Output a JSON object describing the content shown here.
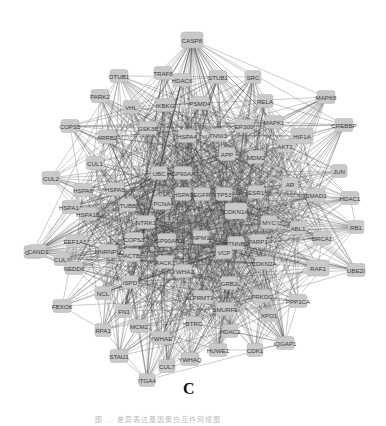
{
  "figure": {
    "panel_label": "C",
    "caption": "图 … 差异表达基因蛋白互作网络图",
    "node_color": "#c9c9c9",
    "edge_color": "#3a3a3a"
  },
  "network": {
    "hub_node": "CASP8",
    "nodes": [
      {
        "id": "CASP8",
        "x": 192,
        "y": 40,
        "w": 22,
        "h": 16
      },
      {
        "id": "OTUB1",
        "x": 119,
        "y": 76,
        "w": 18,
        "h": 13
      },
      {
        "id": "TRAF6",
        "x": 163,
        "y": 73,
        "w": 18,
        "h": 13
      },
      {
        "id": "HDAC6",
        "x": 182,
        "y": 80,
        "w": 18,
        "h": 13
      },
      {
        "id": "STUB1",
        "x": 218,
        "y": 77,
        "w": 18,
        "h": 13
      },
      {
        "id": "SRC",
        "x": 253,
        "y": 77,
        "w": 16,
        "h": 13
      },
      {
        "id": "PARK2",
        "x": 100,
        "y": 96,
        "w": 18,
        "h": 13
      },
      {
        "id": "VHL",
        "x": 131,
        "y": 107,
        "w": 16,
        "h": 13
      },
      {
        "id": "IKBKG",
        "x": 165,
        "y": 105,
        "w": 18,
        "h": 13
      },
      {
        "id": "PSMD4",
        "x": 200,
        "y": 103,
        "w": 18,
        "h": 13
      },
      {
        "id": "RELA",
        "x": 265,
        "y": 101,
        "w": 16,
        "h": 13
      },
      {
        "id": "MAPK8",
        "x": 326,
        "y": 97,
        "w": 18,
        "h": 13
      },
      {
        "id": "COPS5",
        "x": 70,
        "y": 126,
        "w": 18,
        "h": 13
      },
      {
        "id": "GSK3B",
        "x": 148,
        "y": 128,
        "w": 18,
        "h": 13
      },
      {
        "id": "HSPA4",
        "x": 187,
        "y": 136,
        "w": 18,
        "h": 13
      },
      {
        "id": "EP300",
        "x": 244,
        "y": 126,
        "w": 18,
        "h": 13
      },
      {
        "id": "MAPK1",
        "x": 274,
        "y": 122,
        "w": 18,
        "h": 13
      },
      {
        "id": "HIF1A",
        "x": 302,
        "y": 136,
        "w": 22,
        "h": 16
      },
      {
        "id": "CREBBP",
        "x": 344,
        "y": 125,
        "w": 18,
        "h": 13
      },
      {
        "id": "ARRB2",
        "x": 107,
        "y": 137,
        "w": 18,
        "h": 13
      },
      {
        "id": "TNNI3",
        "x": 218,
        "y": 135,
        "w": 16,
        "h": 13
      },
      {
        "id": "AKT1",
        "x": 285,
        "y": 146,
        "w": 16,
        "h": 13
      },
      {
        "id": "CUL1",
        "x": 95,
        "y": 163,
        "w": 18,
        "h": 13
      },
      {
        "id": "UBC",
        "x": 159,
        "y": 173,
        "w": 16,
        "h": 13
      },
      {
        "id": "HSP90AA1",
        "x": 183,
        "y": 173,
        "w": 18,
        "h": 13
      },
      {
        "id": "APP",
        "x": 227,
        "y": 154,
        "w": 16,
        "h": 13
      },
      {
        "id": "MDM2",
        "x": 256,
        "y": 157,
        "w": 16,
        "h": 13
      },
      {
        "id": "JUN",
        "x": 339,
        "y": 171,
        "w": 16,
        "h": 13
      },
      {
        "id": "CUL2",
        "x": 51,
        "y": 178,
        "w": 18,
        "h": 13
      },
      {
        "id": "HSPA8",
        "x": 83,
        "y": 190,
        "w": 18,
        "h": 13
      },
      {
        "id": "HSPA5",
        "x": 115,
        "y": 189,
        "w": 18,
        "h": 13
      },
      {
        "id": "TUBB",
        "x": 128,
        "y": 205,
        "w": 16,
        "h": 13
      },
      {
        "id": "PCNA",
        "x": 162,
        "y": 203,
        "w": 18,
        "h": 13
      },
      {
        "id": "HSPA9",
        "x": 183,
        "y": 194,
        "w": 16,
        "h": 13
      },
      {
        "id": "EGFR",
        "x": 202,
        "y": 194,
        "w": 16,
        "h": 13
      },
      {
        "id": "TP53",
        "x": 224,
        "y": 194,
        "w": 16,
        "h": 13
      },
      {
        "id": "ESR1",
        "x": 256,
        "y": 192,
        "w": 16,
        "h": 13
      },
      {
        "id": "AR",
        "x": 290,
        "y": 184,
        "w": 16,
        "h": 13
      },
      {
        "id": "SMAD3",
        "x": 316,
        "y": 195,
        "w": 18,
        "h": 13
      },
      {
        "id": "HDAC1",
        "x": 350,
        "y": 198,
        "w": 18,
        "h": 13
      },
      {
        "id": "HSPA1A",
        "x": 71,
        "y": 207,
        "w": 18,
        "h": 13
      },
      {
        "id": "HSPA1B",
        "x": 88,
        "y": 214,
        "w": 18,
        "h": 13
      },
      {
        "id": "CDKN1A",
        "x": 236,
        "y": 211,
        "w": 22,
        "h": 16
      },
      {
        "id": "NTRK1",
        "x": 146,
        "y": 222,
        "w": 18,
        "h": 13
      },
      {
        "id": "MYC",
        "x": 269,
        "y": 222,
        "w": 16,
        "h": 13
      },
      {
        "id": "ABL1",
        "x": 298,
        "y": 228,
        "w": 16,
        "h": 13
      },
      {
        "id": "CUL3",
        "x": 33,
        "y": 252,
        "w": 18,
        "h": 13
      },
      {
        "id": "CAND1",
        "x": 38,
        "y": 251,
        "w": 18,
        "h": 13
      },
      {
        "id": "EEF1A1",
        "x": 75,
        "y": 241,
        "w": 18,
        "h": 13
      },
      {
        "id": "COPS3",
        "x": 134,
        "y": 239,
        "w": 18,
        "h": 13
      },
      {
        "id": "HSP90AB1",
        "x": 167,
        "y": 240,
        "w": 18,
        "h": 13
      },
      {
        "id": "NPM1",
        "x": 201,
        "y": 237,
        "w": 16,
        "h": 13
      },
      {
        "id": "CTNNB1",
        "x": 236,
        "y": 243,
        "w": 16,
        "h": 13
      },
      {
        "id": "VCP",
        "x": 224,
        "y": 252,
        "w": 16,
        "h": 13
      },
      {
        "id": "PARP1",
        "x": 258,
        "y": 241,
        "w": 16,
        "h": 13
      },
      {
        "id": "RB1",
        "x": 356,
        "y": 227,
        "w": 16,
        "h": 13
      },
      {
        "id": "BRCA1",
        "x": 322,
        "y": 238,
        "w": 18,
        "h": 13
      },
      {
        "id": "CUL3b",
        "label": "CUL3",
        "x": 62,
        "y": 259,
        "w": 16,
        "h": 13
      },
      {
        "id": "HNRNPU",
        "x": 108,
        "y": 251,
        "w": 18,
        "h": 13
      },
      {
        "id": "ACTB",
        "x": 132,
        "y": 255,
        "w": 16,
        "h": 13
      },
      {
        "id": "RACK1",
        "x": 165,
        "y": 262,
        "w": 16,
        "h": 13
      },
      {
        "id": "NEWSPI",
        "label": "NEDD8",
        "x": 74,
        "y": 268,
        "w": 18,
        "h": 13
      },
      {
        "id": "YWHAZ",
        "x": 183,
        "y": 271,
        "w": 18,
        "h": 13
      },
      {
        "id": "CDKN2A",
        "x": 264,
        "y": 263,
        "w": 18,
        "h": 13
      },
      {
        "id": "RAF1",
        "x": 318,
        "y": 268,
        "w": 22,
        "h": 16
      },
      {
        "id": "UBE2I",
        "x": 356,
        "y": 270,
        "w": 18,
        "h": 13
      },
      {
        "id": "GRB2",
        "x": 229,
        "y": 283,
        "w": 16,
        "h": 13
      },
      {
        "id": "FBXO6",
        "x": 62,
        "y": 306,
        "w": 18,
        "h": 13
      },
      {
        "id": "NCL",
        "x": 103,
        "y": 293,
        "w": 16,
        "h": 13
      },
      {
        "id": "ISPD",
        "x": 130,
        "y": 282,
        "w": 16,
        "h": 13
      },
      {
        "id": "PRMT1",
        "x": 203,
        "y": 297,
        "w": 18,
        "h": 13
      },
      {
        "id": "PRKDC",
        "x": 262,
        "y": 296,
        "w": 18,
        "h": 13
      },
      {
        "id": "PPP1CA",
        "x": 298,
        "y": 301,
        "w": 18,
        "h": 13
      },
      {
        "id": "FN1",
        "x": 124,
        "y": 311,
        "w": 16,
        "h": 13
      },
      {
        "id": "SMURF1",
        "x": 225,
        "y": 309,
        "w": 18,
        "h": 13
      },
      {
        "id": "XPO1",
        "x": 269,
        "y": 315,
        "w": 16,
        "h": 13
      },
      {
        "id": "RPA1",
        "x": 103,
        "y": 330,
        "w": 16,
        "h": 13
      },
      {
        "id": "MCM2",
        "x": 139,
        "y": 326,
        "w": 18,
        "h": 13
      },
      {
        "id": "BTRC",
        "x": 194,
        "y": 323,
        "w": 16,
        "h": 13
      },
      {
        "id": "HDAC2",
        "x": 230,
        "y": 331,
        "w": 16,
        "h": 13
      },
      {
        "id": "YWHAE",
        "x": 161,
        "y": 338,
        "w": 18,
        "h": 13
      },
      {
        "id": "STAU1",
        "x": 119,
        "y": 356,
        "w": 18,
        "h": 13
      },
      {
        "id": "YWHAQ",
        "x": 190,
        "y": 359,
        "w": 18,
        "h": 13
      },
      {
        "id": "HUWE1",
        "x": 218,
        "y": 350,
        "w": 18,
        "h": 13
      },
      {
        "id": "CDK1",
        "x": 255,
        "y": 350,
        "w": 16,
        "h": 13
      },
      {
        "id": "IQGAP1",
        "x": 285,
        "y": 343,
        "w": 18,
        "h": 13
      },
      {
        "id": "CUL7",
        "x": 167,
        "y": 366,
        "w": 16,
        "h": 13
      },
      {
        "id": "ITGA4",
        "x": 147,
        "y": 380,
        "w": 16,
        "h": 13
      }
    ]
  }
}
